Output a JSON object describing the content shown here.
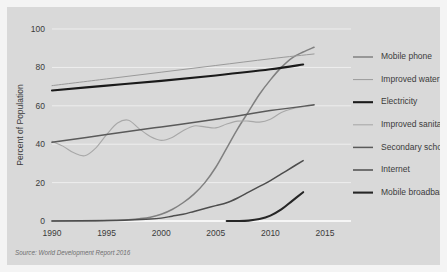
{
  "figure": {
    "background_color": "#f4f4f4",
    "panel_color": "#d9d9d9",
    "gridline_color": "#f0f0f0",
    "axis_color": "#ffffff"
  },
  "source": {
    "note": "Source: World Development Report 2016"
  },
  "chart_data": {
    "type": "line",
    "title": "",
    "subtitle": "",
    "xlabel": "",
    "ylabel": "Percent of Population",
    "xlim": [
      1990,
      2015
    ],
    "ylim": [
      0,
      100
    ],
    "xticks": [
      1990,
      1995,
      2000,
      2005,
      2010,
      2015
    ],
    "xtick_labels": [
      "1990",
      "1995",
      "2000",
      "2005",
      "2010",
      "2015"
    ],
    "yticks": [
      0,
      20,
      40,
      60,
      80,
      100
    ],
    "ytick_labels": [
      "0",
      "20",
      "40",
      "60",
      "80",
      "100"
    ],
    "grid": true,
    "grid_axis": "y",
    "legend_position": "right",
    "annotations": [],
    "series": [
      {
        "name": "Mobile phone",
        "color": "#808080",
        "width": 1.5,
        "x": [
          1990,
          1992,
          1994,
          1996,
          1997,
          1998,
          1999,
          2000,
          2001,
          2002,
          2003,
          2004,
          2005,
          2006,
          2007,
          2008,
          2009,
          2010,
          2011,
          2012,
          2013,
          2014
        ],
        "values": [
          0,
          0,
          0,
          0.4,
          0.7,
          1.2,
          2,
          3.5,
          6,
          9.5,
          14,
          20,
          28,
          38,
          48,
          57,
          66,
          73.5,
          80,
          85,
          88,
          90.5
        ]
      },
      {
        "name": "Improved water",
        "color": "#9a9a9a",
        "width": 1.0,
        "x": [
          1990,
          1995,
          2000,
          2005,
          2010,
          2014
        ],
        "values": [
          70.5,
          74,
          77.5,
          81,
          84.5,
          87
        ]
      },
      {
        "name": "Electricity",
        "color": "#1a1a1a",
        "width": 2.1,
        "x": [
          1990,
          1995,
          2000,
          2005,
          2010,
          2013
        ],
        "values": [
          68,
          70.5,
          73,
          75.8,
          79,
          81.5
        ]
      },
      {
        "name": "Improved sanitation",
        "color": "#a8a8a8",
        "width": 1.1,
        "x": [
          1990,
          1991,
          1992,
          1993,
          1994,
          1995,
          1996,
          1997,
          1998,
          1999,
          2000,
          2001,
          2002,
          2003,
          2004,
          2005,
          2006,
          2007,
          2008,
          2009,
          2010,
          2011,
          2012,
          2013,
          2014
        ],
        "values": [
          41.5,
          39,
          35.5,
          34,
          38,
          45,
          51,
          52.5,
          48,
          44,
          42,
          43.5,
          47,
          49.5,
          49,
          48.5,
          50.5,
          52,
          52,
          51.5,
          53,
          56.5,
          58.5,
          59.5,
          60.5
        ]
      },
      {
        "name": "Secondary school",
        "color": "#5a5a5a",
        "width": 1.5,
        "x": [
          1990,
          1995,
          2000,
          2005,
          2010,
          2014
        ],
        "values": [
          41,
          45,
          49,
          53,
          57.5,
          60.5
        ]
      },
      {
        "name": "Internet",
        "color": "#4d4d4d",
        "width": 1.5,
        "x": [
          1990,
          1995,
          1997,
          1999,
          2000,
          2001,
          2002,
          2003,
          2004,
          2005,
          2006,
          2007,
          2008,
          2009,
          2010,
          2011,
          2012,
          2013
        ],
        "values": [
          0,
          0.2,
          0.5,
          1,
          1.5,
          2.5,
          3.5,
          5,
          6.5,
          8,
          9.5,
          12,
          15,
          18,
          21,
          24.5,
          28,
          31.5
        ]
      },
      {
        "name": "Mobile broadband",
        "color": "#262626",
        "width": 2.1,
        "x": [
          2006,
          2007,
          2008,
          2009,
          2010,
          2011,
          2012,
          2013
        ],
        "values": [
          0,
          0,
          0.2,
          1,
          2.8,
          6,
          10.5,
          15
        ]
      }
    ]
  }
}
